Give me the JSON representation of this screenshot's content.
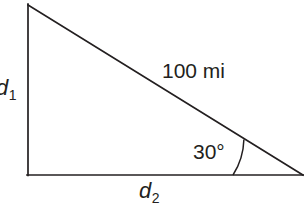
{
  "figure": {
    "type": "right-triangle-diagram",
    "background_color": "#ffffff",
    "stroke_color": "#231f20",
    "labels": {
      "vertical_leg": "d",
      "vertical_leg_subscript": "1",
      "horizontal_leg": "d",
      "horizontal_leg_subscript": "2",
      "hypotenuse": "100 mi",
      "angle": "30°"
    },
    "geometry": {
      "apex": {
        "x": 28,
        "y": 5
      },
      "right_angle_vertex": {
        "x": 28,
        "y": 175
      },
      "angle_vertex": {
        "x": 303,
        "y": 175
      },
      "arc_radius": 70,
      "angle_degrees": 30
    }
  }
}
